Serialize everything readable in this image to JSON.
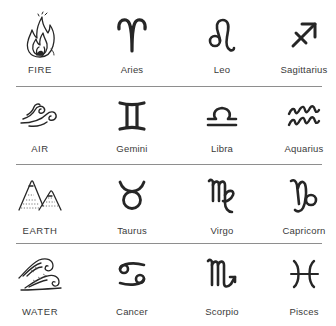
{
  "colors": {
    "background": "#ffffff",
    "ink": "#262626",
    "label": "#3a3a3a",
    "divider": "#8e8e8e"
  },
  "rows": [
    {
      "element": {
        "label": "FIRE",
        "icon": "fire-icon"
      },
      "signs": [
        {
          "label": "Aries",
          "icon": "aries-icon",
          "glyph": "♈"
        },
        {
          "label": "Leo",
          "icon": "leo-icon",
          "glyph": "♌"
        },
        {
          "label": "Sagittarius",
          "icon": "sagittarius-icon",
          "glyph": "♐"
        }
      ]
    },
    {
      "element": {
        "label": "AIR",
        "icon": "air-icon"
      },
      "signs": [
        {
          "label": "Gemini",
          "icon": "gemini-icon",
          "glyph": "♊"
        },
        {
          "label": "Libra",
          "icon": "libra-icon",
          "glyph": "♎"
        },
        {
          "label": "Aquarius",
          "icon": "aquarius-icon",
          "glyph": "♒"
        }
      ]
    },
    {
      "element": {
        "label": "EARTH",
        "icon": "earth-icon"
      },
      "signs": [
        {
          "label": "Taurus",
          "icon": "taurus-icon",
          "glyph": "♉"
        },
        {
          "label": "Virgo",
          "icon": "virgo-icon",
          "glyph": "♍"
        },
        {
          "label": "Capricorn",
          "icon": "capricorn-icon",
          "glyph": "♑"
        }
      ]
    },
    {
      "element": {
        "label": "WATER",
        "icon": "water-icon"
      },
      "signs": [
        {
          "label": "Cancer",
          "icon": "cancer-icon",
          "glyph": "♋"
        },
        {
          "label": "Scorpio",
          "icon": "scorpio-icon",
          "glyph": "♏"
        },
        {
          "label": "Pisces",
          "icon": "pisces-icon",
          "glyph": "♓"
        }
      ]
    }
  ]
}
